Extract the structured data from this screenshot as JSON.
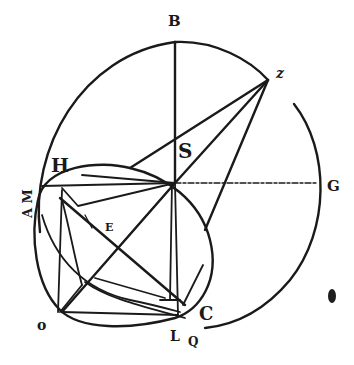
{
  "figure": {
    "type": "geometric construction (woodcut style)",
    "labels": {
      "B": "B",
      "Z": "z",
      "S": "S",
      "H": "H",
      "AM": "A M",
      "G": "G",
      "E": "E",
      "O": "o",
      "L": "L",
      "Q": "Q",
      "C": "C"
    },
    "colors": {
      "ink": "#1a1a1a",
      "paper": "#ffffff"
    }
  }
}
